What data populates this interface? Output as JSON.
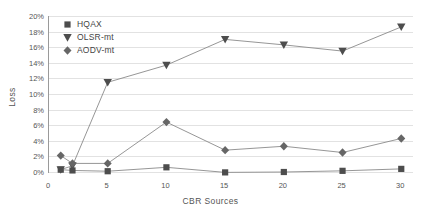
{
  "chart_data": {
    "type": "line",
    "title": "",
    "xlabel": "CBR Sources",
    "ylabel": "Loss",
    "x": [
      1,
      2,
      5,
      10,
      15,
      20,
      25,
      30
    ],
    "xlim": [
      0,
      31
    ],
    "ylim": [
      0,
      20
    ],
    "xticks": [
      "0",
      "5",
      "10",
      "15",
      "20",
      "25",
      "30"
    ],
    "xtick_values": [
      0,
      5,
      10,
      15,
      20,
      25,
      30
    ],
    "yticks": [
      "0%",
      "2%",
      "4%",
      "6%",
      "8%",
      "10%",
      "12%",
      "14%",
      "16%",
      "18%",
      "20%"
    ],
    "ytick_values": [
      0,
      2,
      4,
      6,
      8,
      10,
      12,
      14,
      16,
      18,
      20
    ],
    "grid": "horizontal",
    "legend_position": "top-left",
    "series": [
      {
        "name": "HQAX",
        "marker": "square",
        "color": "#4d4d4d",
        "values": [
          0.3,
          0.2,
          0.1,
          0.6,
          -0.05,
          0.0,
          0.15,
          0.4
        ]
      },
      {
        "name": "OLSR-mt",
        "marker": "triangle-down",
        "color": "#4d4d4d",
        "values": [
          0.3,
          0.8,
          11.5,
          13.7,
          17.0,
          16.3,
          15.5,
          18.6
        ]
      },
      {
        "name": "AODV-mt",
        "marker": "diamond",
        "color": "#666666",
        "values": [
          2.1,
          1.1,
          1.1,
          6.4,
          2.8,
          3.3,
          2.5,
          4.3
        ]
      }
    ]
  },
  "axes": {
    "x_title": "CBR Sources",
    "y_title": "Loss"
  },
  "legend": {
    "items": [
      {
        "label": "HQAX",
        "icon": "square-marker-icon"
      },
      {
        "label": "OLSR-mt",
        "icon": "triangle-down-marker-icon"
      },
      {
        "label": "AODV-mt",
        "icon": "diamond-marker-icon"
      }
    ]
  },
  "style": {
    "line_color": "#8a8a8a",
    "grid_color": "#e2e2e2",
    "axis_color": "#9a9a9a",
    "text_color": "#555555",
    "background": "#ffffff"
  }
}
